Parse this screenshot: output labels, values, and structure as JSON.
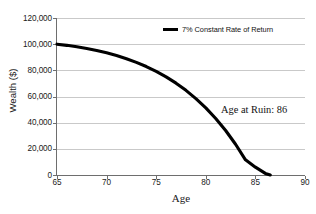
{
  "chart_data": {
    "type": "line",
    "title": "",
    "xlabel": "Age",
    "ylabel": "Wealth ($)",
    "xlim": [
      65,
      90
    ],
    "ylim": [
      0,
      120000
    ],
    "xticks": [
      65,
      70,
      75,
      80,
      85,
      90
    ],
    "xticklabels": [
      "65",
      "70",
      "75",
      "80",
      "85",
      "90"
    ],
    "yticks": [
      0,
      20000,
      40000,
      60000,
      80000,
      100000,
      120000
    ],
    "yticklabels": [
      "0",
      "20,000",
      "40,000",
      "60,000",
      "80,000",
      "100,000",
      "120,000"
    ],
    "grid": "horizontal",
    "legend_position": "top-center",
    "series": [
      {
        "name": "7% Constant Rate of Return",
        "color": "#000000",
        "x": [
          65,
          66,
          67,
          68,
          69,
          70,
          71,
          72,
          73,
          74,
          75,
          76,
          77,
          78,
          79,
          80,
          81,
          82,
          83,
          84,
          85,
          86,
          86.5
        ],
        "values": [
          100000,
          99100,
          98000,
          96700,
          95200,
          93400,
          91300,
          88900,
          86100,
          82900,
          79200,
          75000,
          70200,
          64700,
          58400,
          51300,
          43200,
          34000,
          23500,
          11600,
          6000,
          1200,
          0
        ]
      }
    ],
    "annotations": [
      {
        "text": "Age at Ruin: 86",
        "x": 84,
        "y": 48000
      }
    ]
  },
  "legend": {
    "entries": [
      {
        "label": "7% Constant Rate of Return",
        "color": "#000000"
      }
    ]
  },
  "axes": {
    "x_title": "Age",
    "y_title": "Wealth ($)"
  },
  "colors": {
    "series": "#000000",
    "gridline": "#c9c9c9",
    "axis": "#6e6e6e",
    "text": "#1a1a1a",
    "background": "#ffffff"
  }
}
